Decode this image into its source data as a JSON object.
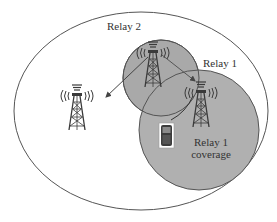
{
  "diagram": {
    "type": "relay-network-coverage",
    "colors": {
      "background": "#ffffff",
      "outline": "#555555",
      "coverage_fill": "#a9a9a9",
      "tower": "#3a3a3a",
      "arrow": "#444444",
      "text": "#333333"
    },
    "labels": {
      "relay2": "Relay 2",
      "relay1": "Relay 1",
      "relay1_coverage_line1": "Relay 1",
      "relay1_coverage_line2": "coverage"
    },
    "nodes": [
      {
        "id": "base-station",
        "icon": "cell-tower-icon"
      },
      {
        "id": "relay-2",
        "icon": "cell-tower-icon",
        "label": "Relay 2"
      },
      {
        "id": "relay-1",
        "icon": "cell-tower-icon",
        "label": "Relay 1"
      },
      {
        "id": "mobile-device",
        "icon": "mobile-phone-icon"
      }
    ],
    "edges": [
      {
        "from": "relay-2",
        "to": "base-station",
        "style": "arrow"
      },
      {
        "from": "relay-2",
        "to": "relay-1",
        "style": "arrow"
      },
      {
        "from": "relay-1",
        "to": "mobile-device",
        "style": "line"
      }
    ],
    "regions": [
      {
        "id": "overall-cell",
        "shape": "ellipse"
      },
      {
        "id": "relay-2-coverage",
        "shape": "circle"
      },
      {
        "id": "relay-1-coverage",
        "shape": "circle",
        "label": "Relay 1 coverage"
      }
    ]
  }
}
